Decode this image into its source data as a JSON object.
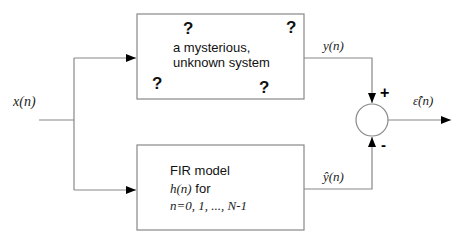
{
  "diagram": {
    "type": "system-identification-block-diagram",
    "input": {
      "label": "x(n)"
    },
    "unknown_system": {
      "line1": "a mysterious,",
      "line2": "unknown system",
      "question_mark": "?"
    },
    "fir_model": {
      "title": "FIR model",
      "line2_var": "h(n)",
      "line2_rest": " for",
      "line3": "n=0, 1, ..., N-1"
    },
    "signals": {
      "y": "y(n)",
      "y_hat": "ŷ(n)",
      "error": "ε̂(n)"
    },
    "summing_junction": {
      "plus_sign": "+",
      "minus_sign": "-"
    },
    "colors": {
      "line": "#888888",
      "arrow": "#000000",
      "text": "#111111"
    }
  }
}
